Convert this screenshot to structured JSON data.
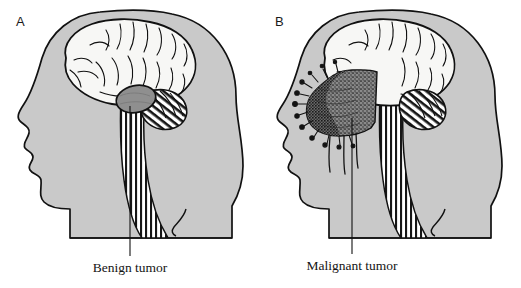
{
  "figure": {
    "type": "medical-illustration",
    "background_color": "#ffffff",
    "panels": [
      {
        "id": "A",
        "label": "A",
        "caption": "Benign tumor",
        "tumor": {
          "name": "benign-tumor",
          "description": "small smooth-edged oval mass at the base of the cerebrum",
          "fill_color": "#8f8f8f",
          "border_style": "smooth, well-circumscribed"
        },
        "anatomy": [
          {
            "name": "head-profile",
            "label": "Head profile",
            "fill_color": "#c9c9c9"
          },
          {
            "name": "cerebrum",
            "label": "Cerebrum",
            "fill_color": "#f7f7f5"
          },
          {
            "name": "cerebellum",
            "label": "Cerebellum",
            "fill_color": "#ffffff",
            "pattern": "diagonal-hatch"
          },
          {
            "name": "brainstem-spinal-cord",
            "label": "Brainstem and spinal cord",
            "fill_color": "#ffffff",
            "pattern": "vertical-stripes"
          }
        ]
      },
      {
        "id": "B",
        "label": "B",
        "caption": "Malignant tumor",
        "tumor": {
          "name": "malignant-tumor",
          "description": "large dark stippled mass with irregular spiky infiltrating margins invading surrounding brain tissue",
          "fill_color": "#7b7b7b",
          "border_style": "irregular, infiltrating, spiculated"
        },
        "anatomy": [
          {
            "name": "head-profile",
            "label": "Head profile",
            "fill_color": "#c9c9c9"
          },
          {
            "name": "cerebrum",
            "label": "Cerebrum",
            "fill_color": "#f7f7f5"
          },
          {
            "name": "cerebellum",
            "label": "Cerebellum",
            "fill_color": "#ffffff",
            "pattern": "diagonal-hatch"
          },
          {
            "name": "brainstem-spinal-cord",
            "label": "Brainstem and spinal cord",
            "fill_color": "#ffffff",
            "pattern": "vertical-stripes"
          }
        ]
      }
    ],
    "colors": {
      "line": "#111111",
      "head_fill": "#c9c9c9",
      "brain_fill": "#f7f7f5",
      "benign_fill": "#8f8f8f",
      "malignant_fill": "#7b7b7b",
      "text": "#141414"
    }
  }
}
